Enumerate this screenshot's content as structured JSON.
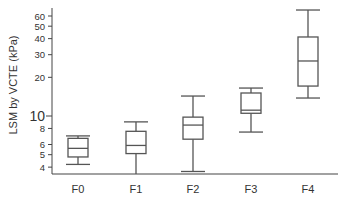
{
  "chart_data": {
    "type": "box",
    "title": "",
    "xlabel": "",
    "ylabel": "LSM by VCTE (kPa)",
    "yscale": "log",
    "ylim": [
      3.5,
      70
    ],
    "yticks": [
      4,
      5,
      6,
      8,
      10,
      20,
      30,
      40,
      50,
      60
    ],
    "ytick_labels": [
      "4",
      "5",
      "6",
      "8",
      "10",
      "20",
      "30",
      "40",
      "50",
      "60"
    ],
    "major_ytick": 10,
    "categories": [
      "F0",
      "F1",
      "F2",
      "F3",
      "F4"
    ],
    "series": [
      {
        "name": "F0",
        "whisker_low": 4.2,
        "q1": 4.8,
        "median": 5.6,
        "q3": 6.7,
        "whisker_high": 7.0
      },
      {
        "name": "F1",
        "whisker_low": 3.5,
        "q1": 5.1,
        "median": 5.9,
        "q3": 7.6,
        "whisker_high": 9.0
      },
      {
        "name": "F2",
        "whisker_low": 3.7,
        "q1": 6.6,
        "median": 8.5,
        "q3": 9.8,
        "whisker_high": 14.3
      },
      {
        "name": "F3",
        "whisker_low": 7.5,
        "q1": 10.5,
        "median": 11.1,
        "q3": 15.1,
        "whisker_high": 16.5
      },
      {
        "name": "F4",
        "whisker_low": 13.8,
        "q1": 17.1,
        "median": 26.8,
        "q3": 41.2,
        "whisker_high": 66.8
      }
    ],
    "grid": false,
    "legend": null
  },
  "style": {
    "line_color": "#555555",
    "axis_color": "#444444",
    "text_color": "#333333",
    "box_fill": "#ffffff"
  }
}
